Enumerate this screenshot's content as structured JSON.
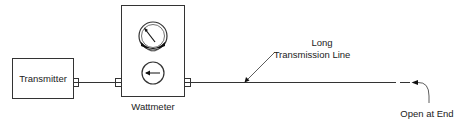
{
  "diagram": {
    "type": "block-diagram",
    "components": {
      "transmitter": {
        "label": "Transmitter"
      },
      "wattmeter": {
        "label": "Wattmeter",
        "icons": [
          "analog-meter-dial-icon",
          "direction-arrow-left-icon"
        ]
      },
      "line": {
        "label_line1": "Long",
        "label_line2": "Transmission Line"
      },
      "termination": {
        "label": "Open at End"
      }
    },
    "colors": {
      "stroke": "#333333",
      "background": "#ffffff",
      "meter_fill": "#111111"
    }
  }
}
